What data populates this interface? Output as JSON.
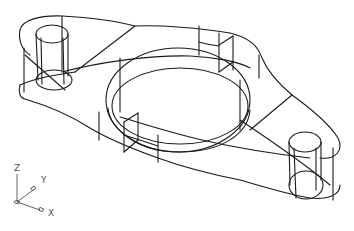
{
  "viewport": {
    "background": "#ffffff",
    "line_color": "#1a1a1a",
    "model": "flanged-bracket-wireframe"
  },
  "ucs_icon": {
    "axes": [
      {
        "label": "Z"
      },
      {
        "label": "Y"
      },
      {
        "label": "X"
      }
    ],
    "color": "#555555"
  }
}
